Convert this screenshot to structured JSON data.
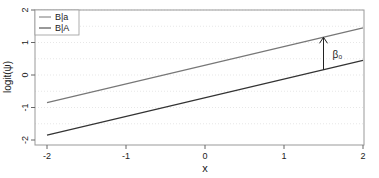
{
  "chart_data": {
    "type": "line",
    "title": "",
    "xlabel": "x",
    "ylabel": "logit(ψ)",
    "xlim": [
      -2,
      2
    ],
    "ylim": [
      -2,
      2
    ],
    "xticks": [
      "-2",
      "-1",
      "0",
      "1",
      "2"
    ],
    "yticks": [
      "-2",
      "-1",
      "0",
      "1",
      "2"
    ],
    "grid": "horizontal dotted",
    "legend_position": "top-left",
    "series": [
      {
        "name": "B|a",
        "x": [
          -2,
          2
        ],
        "y": [
          -0.85,
          1.45
        ],
        "color": "#777777"
      },
      {
        "name": "B|A",
        "x": [
          -2,
          2
        ],
        "y": [
          -1.85,
          0.45
        ],
        "color": "#333333"
      }
    ],
    "annotations": [
      {
        "type": "arrow",
        "x": 1.5,
        "from_y": 0.16,
        "to_y": 1.16,
        "label": "β₀"
      }
    ]
  },
  "legend": {
    "items": [
      "B|a",
      "B|A"
    ]
  },
  "axes": {
    "xlabel": "x",
    "ylabel": "logit(ψ)",
    "annotation_label": "β₀"
  }
}
